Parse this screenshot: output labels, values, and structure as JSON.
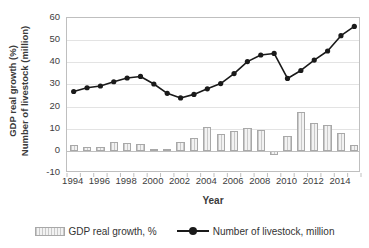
{
  "chart_data": {
    "type": "bar",
    "title": "",
    "subtitle": "",
    "xlabel": "Year",
    "ylabel": "GDP real growth (%) Number of livestock (million)",
    "ylabel_lines": [
      "GDP real growth (%)",
      "Number of livestock (million)"
    ],
    "ylim": [
      -10,
      60
    ],
    "ytick_values": [
      -10,
      0,
      10,
      20,
      30,
      40,
      50,
      60
    ],
    "ytick_labels": [
      "-10",
      "0",
      "10",
      "20",
      "30",
      "40",
      "50",
      "60"
    ],
    "grid": true,
    "legend_position": "bottom",
    "categories": [
      1994,
      1995,
      1996,
      1997,
      1998,
      1999,
      2000,
      2001,
      2002,
      2003,
      2004,
      2005,
      2006,
      2007,
      2008,
      2009,
      2010,
      2011,
      2012,
      2013,
      2014,
      2015
    ],
    "xtick_labels": [
      "1994",
      "1996",
      "1998",
      "2000",
      "2002",
      "2004",
      "2006",
      "2008",
      "2010",
      "2012",
      "2014"
    ],
    "xtick_values": [
      1994,
      1996,
      1998,
      2000,
      2002,
      2004,
      2006,
      2008,
      2010,
      2012,
      2014
    ],
    "series": [
      {
        "name": "GDP real growth, %",
        "type": "bar",
        "color": "#e9e9e9",
        "edge_color": "#a8a8a8",
        "pattern": "vertical-hatch",
        "values": [
          2.6,
          1.8,
          1.9,
          4.0,
          3.4,
          3.0,
          0.8,
          0.7,
          4.0,
          5.9,
          10.7,
          7.4,
          8.8,
          10.3,
          9.2,
          -2.0,
          6.8,
          17.7,
          12.5,
          11.9,
          8.1,
          2.5
        ]
      },
      {
        "name": "Number of livestock, million",
        "type": "line",
        "color": "#1a1a1a",
        "marker": "circle",
        "values": [
          26.8,
          28.5,
          29.3,
          31.2,
          32.9,
          33.6,
          30.2,
          26.0,
          23.9,
          25.5,
          28.0,
          30.4,
          34.9,
          40.3,
          43.3,
          44.0,
          32.7,
          36.3,
          41.0,
          45.1,
          52.0,
          56.2
        ]
      }
    ]
  },
  "legend": {
    "items": [
      {
        "label": "GDP real growth, %",
        "swatch": "bar-hatched"
      },
      {
        "label": "Number of livestock, million",
        "swatch": "line-marker"
      }
    ]
  }
}
